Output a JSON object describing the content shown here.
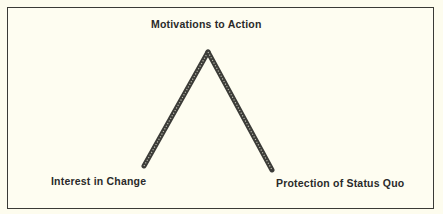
{
  "diagram": {
    "apex": {
      "label": "Motivations to Action"
    },
    "left_base": {
      "label": "Interest in Change"
    },
    "right_base": {
      "label": "Protection of Status Quo"
    },
    "line_color": "#3c3c38",
    "border_color": "#3a3a36",
    "background_color": "#fefdf1"
  }
}
